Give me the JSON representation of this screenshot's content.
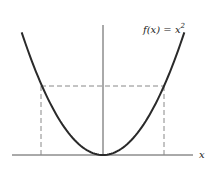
{
  "figure": {
    "function_label": "f(x) = x",
    "function_exponent": "2",
    "x_axis_label": "x",
    "colors": {
      "curve": "#2a2a2a",
      "axis": "#555555",
      "dashed": "#888888"
    }
  },
  "chart_data": {
    "type": "line",
    "title": "",
    "function": "f(x) = x^2",
    "xlabel": "x",
    "ylabel": "",
    "x_range": [
      -1.6,
      1.6
    ],
    "markers": {
      "x_values": [
        -1.2,
        1.2
      ],
      "y_value": 1.44,
      "style": "dashed"
    },
    "grid": false
  }
}
